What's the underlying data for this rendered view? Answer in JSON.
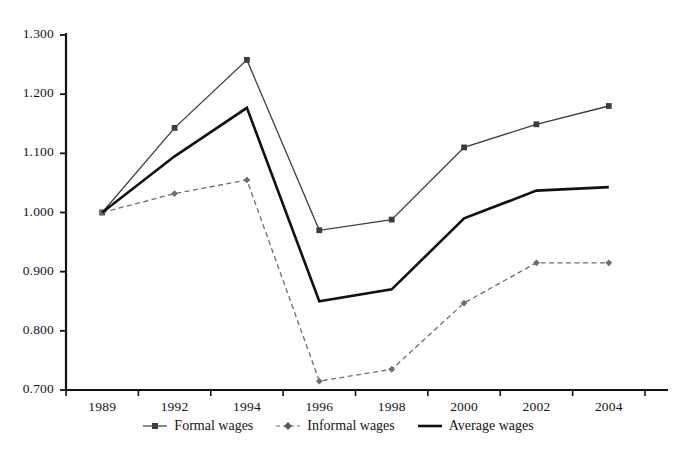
{
  "chart_data": {
    "type": "line",
    "title": "",
    "subtitle": "",
    "xlabel": "",
    "ylabel": "",
    "x": [
      "1989",
      "1992",
      "1994",
      "1996",
      "1998",
      "2000",
      "2002",
      "2004"
    ],
    "categories": [
      "1989",
      "1992",
      "1994",
      "1996",
      "1998",
      "2000",
      "2002",
      "2004"
    ],
    "xtick_labels": [
      "1989",
      "1992",
      "1994",
      "1996",
      "1998",
      "2000",
      "2002",
      "2004"
    ],
    "ytick_labels": [
      "1.300",
      "1.200",
      "1.100",
      "1.000",
      "0.900",
      "0.800",
      "0.700"
    ],
    "ytick_values": [
      1.3,
      1.2,
      1.1,
      1.0,
      0.9,
      0.8,
      0.7
    ],
    "ylim": [
      0.7,
      1.3
    ],
    "grid": false,
    "legend_position": "bottom",
    "series": [
      {
        "name": "Formal wages",
        "marker": "square",
        "line_style": "solid-thin",
        "color": "#3d3d3d",
        "values": [
          1.0,
          1.143,
          1.258,
          0.97,
          0.988,
          1.11,
          1.149,
          1.18
        ]
      },
      {
        "name": "Informal wages",
        "marker": "diamond",
        "line_style": "dashed",
        "color": "#6e6e6e",
        "values": [
          1.0,
          1.032,
          1.055,
          0.715,
          0.735,
          0.847,
          0.915,
          0.915
        ]
      },
      {
        "name": "Average wages",
        "marker": "none",
        "line_style": "solid-thick",
        "color": "#111111",
        "values": [
          1.0,
          1.095,
          1.177,
          0.85,
          0.87,
          0.99,
          1.037,
          1.043
        ]
      }
    ]
  },
  "legend": {
    "items": [
      {
        "label": "Formal wages",
        "marker": "square-line-marker"
      },
      {
        "label": "Informal wages",
        "marker": "diamond-dashed-marker"
      },
      {
        "label": "Average wages",
        "marker": "thick-line-marker"
      }
    ]
  },
  "axes": {
    "y_axis_name": "value-axis",
    "x_axis_name": "year-axis"
  }
}
